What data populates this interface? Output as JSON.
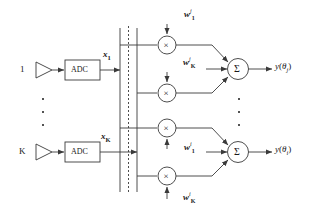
{
  "figure": {
    "kind": "digital-beamforming-block-diagram",
    "width": 311,
    "height": 216,
    "line_color": "#3a3a3a",
    "text_color": "#1a1a1a",
    "background": "#ffffff"
  },
  "inputs": [
    {
      "id": "ch1",
      "port_label": "1",
      "adc_label": "ADC",
      "signal": "x",
      "signal_sub": "1",
      "y": 70
    },
    {
      "id": "chK",
      "port_label": "K",
      "adc_label": "ADC",
      "signal": "x",
      "signal_sub": "K",
      "y": 152
    }
  ],
  "bus": {
    "name": "data-bus",
    "left_x": 120,
    "dashed_x": 128,
    "right_x": 137,
    "top_y": 28,
    "bottom_y": 192
  },
  "beams": [
    {
      "id": "beam-j",
      "superscript": "j",
      "sum_symbol": "Σ",
      "output": "y",
      "output_arg_open": "(",
      "output_theta": "θ",
      "output_sub": "j",
      "output_arg_close": ")",
      "weights": [
        {
          "symbol": "w",
          "sub": "1",
          "sup": "j",
          "arrow": "down",
          "x": 190,
          "y": 14
        },
        {
          "symbol": "w",
          "sub": "K",
          "sup": "j",
          "arrow": "down",
          "x": 190,
          "y": 62
        }
      ],
      "multipliers": [
        {
          "symbol": "×",
          "cx": 167,
          "cy": 45
        },
        {
          "symbol": "×",
          "cx": 167,
          "cy": 93
        }
      ],
      "sum_node": {
        "cx": 238,
        "cy": 69
      }
    },
    {
      "id": "beam-i",
      "superscript": "i",
      "sum_symbol": "Σ",
      "output": "y",
      "output_arg_open": "(",
      "output_theta": "θ",
      "output_sub": "i",
      "output_arg_close": ")",
      "weights": [
        {
          "symbol": "w",
          "sub": "1",
          "sup": "i",
          "arrow": "up",
          "x": 190,
          "y": 146
        },
        {
          "symbol": "w",
          "sub": "K",
          "sup": "i",
          "arrow": "up",
          "x": 190,
          "y": 196
        }
      ],
      "multipliers": [
        {
          "symbol": "×",
          "cx": 167,
          "cy": 128
        },
        {
          "symbol": "×",
          "cx": 167,
          "cy": 176
        }
      ],
      "sum_node": {
        "cx": 238,
        "cy": 152
      }
    }
  ],
  "ellipses": [
    {
      "name": "input-channel-ellipsis",
      "x": 42,
      "ys": [
        98,
        111,
        124
      ]
    },
    {
      "name": "beam-output-ellipsis",
      "x": 238,
      "ys": [
        98,
        111,
        124
      ]
    }
  ]
}
